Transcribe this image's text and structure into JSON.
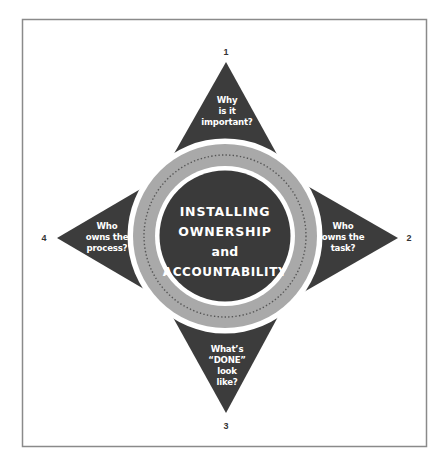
{
  "diagram": {
    "colors": {
      "frame": "#8a8a8a",
      "triangle": "#3c3c3c",
      "ring_outer_white": "#ffffff",
      "ring_gray": "#a9a9a9",
      "ring_dots": "#555555",
      "center": "#3a3a3a",
      "text": "#ffffff",
      "number": "#333333"
    },
    "center": {
      "lines": [
        "INSTALLING",
        "OWNERSHIP",
        "and",
        "ACCOUNTABILITY"
      ]
    },
    "points": [
      {
        "number": "1",
        "position": "top",
        "lines": [
          "Why",
          "is it",
          "important?"
        ]
      },
      {
        "number": "2",
        "position": "right",
        "lines": [
          "Who",
          "owns the",
          "task?"
        ]
      },
      {
        "number": "3",
        "position": "bottom",
        "lines": [
          "What’s",
          "“DONE”",
          "look",
          "like?"
        ]
      },
      {
        "number": "4",
        "position": "left",
        "lines": [
          "Who",
          "owns the",
          "process?"
        ]
      }
    ]
  }
}
